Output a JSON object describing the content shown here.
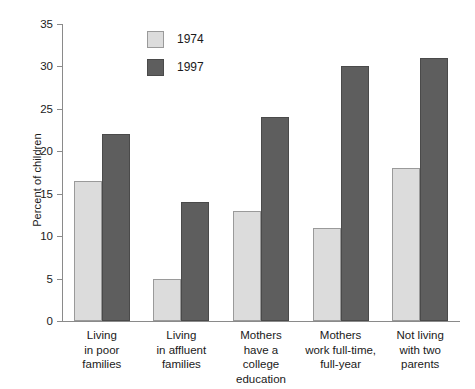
{
  "chart_data": {
    "type": "bar",
    "title": "",
    "xlabel": "",
    "ylabel": "Percent of children",
    "ylim": [
      0,
      35
    ],
    "yticks": [
      0,
      5,
      10,
      15,
      20,
      25,
      30,
      35
    ],
    "ytick_labels": [
      "0",
      "5",
      "10",
      "15",
      "20",
      "25",
      "30",
      "35"
    ],
    "grid": false,
    "legend_position": "upper-center-left",
    "categories": [
      "Living\nin poor\nfamilies",
      "Living\nin affluent\nfamilies",
      "Mothers\nhave a\ncollege\neducation",
      "Mothers\nwork full-time,\nfull-year",
      "Not living\nwith two\nparents"
    ],
    "series": [
      {
        "name": "1974",
        "color": "#dcdcdc",
        "values": [
          16.5,
          5,
          13,
          11,
          18
        ]
      },
      {
        "name": "1997",
        "color": "#5e5e5e",
        "values": [
          22,
          14,
          24,
          30,
          31
        ]
      }
    ]
  },
  "legend": {
    "entries": [
      {
        "label": "1974",
        "swatch": "light-gray-swatch"
      },
      {
        "label": "1997",
        "swatch": "dark-gray-swatch"
      }
    ]
  },
  "axis": {
    "y_title": "Percent of children"
  }
}
